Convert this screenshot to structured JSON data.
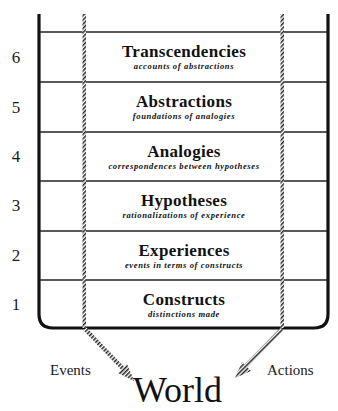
{
  "diagram": {
    "levels": [
      {
        "number": "6",
        "title": "Transcendencies",
        "subtitle": "accounts of abstractions"
      },
      {
        "number": "5",
        "title": "Abstractions",
        "subtitle": "foundations of analogies"
      },
      {
        "number": "4",
        "title": "Analogies",
        "subtitle": "correspondences between hypotheses"
      },
      {
        "number": "3",
        "title": "Hypotheses",
        "subtitle": "rationalizations of experience"
      },
      {
        "number": "2",
        "title": "Experiences",
        "subtitle": "events in terms of constructs"
      },
      {
        "number": "1",
        "title": "Constructs",
        "subtitle": "distinctions made"
      }
    ],
    "left_arrow_label": "Events",
    "right_arrow_label": "Actions",
    "bottom_label": "World",
    "colors": {
      "line": "#111111",
      "background": "#ffffff"
    }
  }
}
